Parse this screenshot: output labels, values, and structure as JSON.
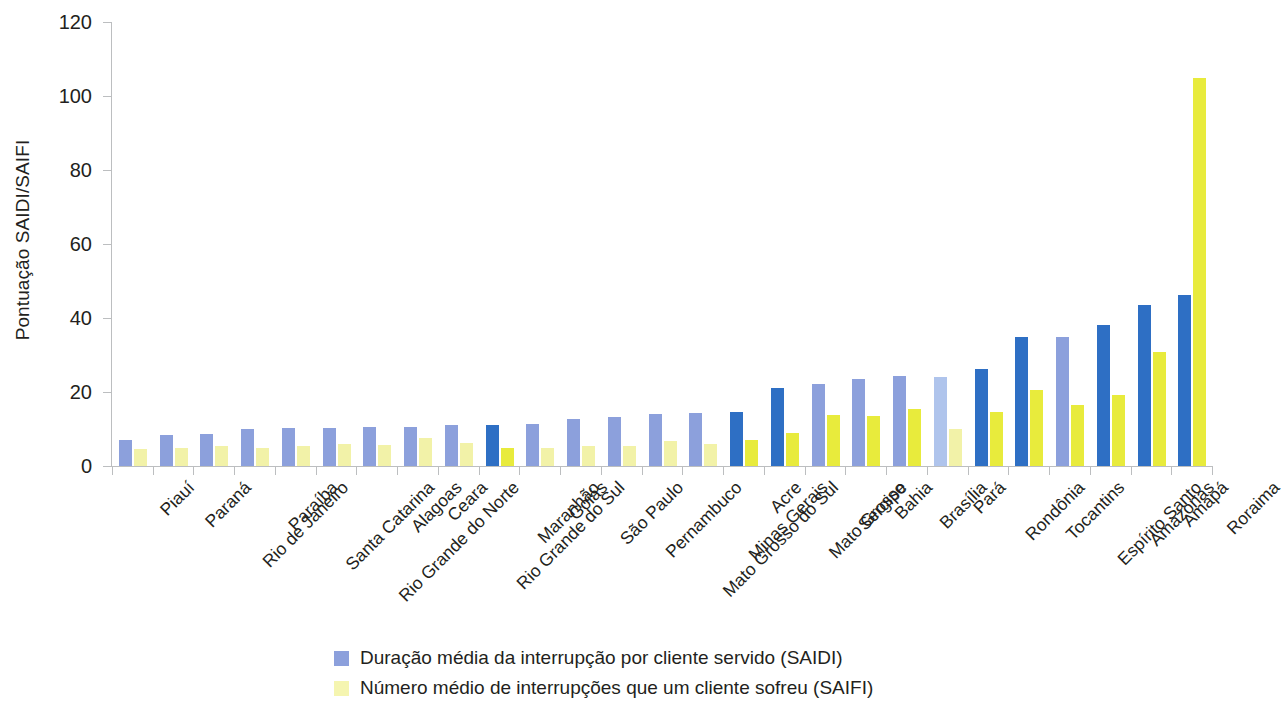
{
  "chart_data": {
    "type": "bar",
    "title": "",
    "subtitle": "",
    "xlabel": "",
    "ylabel": "Pontuação SAIDI/SAIFI",
    "ylim": [
      0,
      120
    ],
    "yticks": [
      0,
      20,
      40,
      60,
      80,
      100,
      120
    ],
    "ytick_labels": [
      "0",
      "20",
      "40",
      "60",
      "80",
      "100",
      "120"
    ],
    "grid": false,
    "legend_position": "bottom",
    "orientation": "vertical",
    "categories": [
      "Piauí",
      "Paraná",
      "Rio de Janeiro",
      "Paraíba",
      "Santa Catarina",
      "Rio Grande do Norte",
      "Alagoas",
      "Ceara",
      "Rio Grande do Sul",
      "Maranhão",
      "Goiás",
      "São Paulo",
      "Pernambuco",
      "Mato Grosso do Sul",
      "Minas Gerais",
      "Acre",
      "Mato Grosso",
      "Sergipe",
      "Bahia",
      "Brasília",
      "Pará",
      "Rondônia",
      "Tocantins",
      "Espírito Santo",
      "Amazonas",
      "Amapá",
      "Roraima"
    ],
    "series": [
      {
        "name": "Duração média da interrupção por cliente servido (SAIDI)",
        "short_name": "SAIDI",
        "color": "#8CA0DC",
        "values": [
          7.0,
          8.3,
          8.7,
          10.0,
          10.3,
          10.4,
          10.5,
          10.6,
          11.0,
          11.0,
          11.3,
          12.6,
          13.3,
          14.0,
          14.4,
          14.5,
          21.0,
          22.3,
          23.4,
          24.2,
          24.0,
          26.3,
          35.0,
          35.0,
          38.0,
          43.5,
          46.3
        ],
        "bar_colors": [
          "#8CA0DC",
          "#8CA0DC",
          "#8CA0DC",
          "#8CA0DC",
          "#8CA0DC",
          "#8CA0DC",
          "#8CA0DC",
          "#8CA0DC",
          "#8CA0DC",
          "#2E6FC4",
          "#8CA0DC",
          "#8CA0DC",
          "#8CA0DC",
          "#8CA0DC",
          "#8CA0DC",
          "#2E6FC4",
          "#2E6FC4",
          "#8CA0DC",
          "#8CA0DC",
          "#8CA0DC",
          "#AFC4EC",
          "#2E6FC4",
          "#2E6FC4",
          "#8CA0DC",
          "#2E6FC4",
          "#2E6FC4",
          "#2E6FC4"
        ]
      },
      {
        "name": "Número médio de interrupções que um cliente sofreu (SAIFI)",
        "short_name": "SAIFI",
        "color": "#F5F5B0",
        "values": [
          4.5,
          5.0,
          5.5,
          5.0,
          5.5,
          6.0,
          5.8,
          7.5,
          6.2,
          4.8,
          5.0,
          5.5,
          5.5,
          6.8,
          6.0,
          7.0,
          9.0,
          13.8,
          13.6,
          15.5,
          10.0,
          14.7,
          20.5,
          16.5,
          19.2,
          30.7,
          105.0
        ],
        "bar_colors": [
          "#F2F2A8",
          "#F2F2A8",
          "#F2F2A8",
          "#F2F2A8",
          "#F2F2A8",
          "#F2F2A8",
          "#F2F2A8",
          "#F2F2A8",
          "#F2F2A8",
          "#E8EB3C",
          "#F2F2A8",
          "#F2F2A8",
          "#F2F2A8",
          "#F2F2A8",
          "#F2F2A8",
          "#E8EB3C",
          "#E8EB3C",
          "#E8EB3C",
          "#E8EB3C",
          "#E8EB3C",
          "#F2F2A8",
          "#E8EB3C",
          "#E8EB3C",
          "#E8EB3C",
          "#E8EB3C",
          "#E8EB3C",
          "#E8EB3C"
        ]
      }
    ]
  },
  "axis": {
    "y_title": "Pontuação SAIDI/SAIFI"
  },
  "legend": {
    "items": [
      {
        "label": "Duração média da interrupção por cliente servido (SAIDI)",
        "color": "#8CA0DC"
      },
      {
        "label": "Número médio de interrupções que um cliente sofreu (SAIFI)",
        "color": "#F5F5B0"
      }
    ]
  }
}
